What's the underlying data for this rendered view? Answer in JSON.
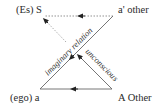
{
  "diagram": {
    "nodes": {
      "top_left": "(Es) S",
      "top_right": "a' other",
      "bottom_left": "(ego) a",
      "bottom_right": "A Other"
    },
    "edges": {
      "imaginary": "imaginary relation",
      "unconscious": "unconscious"
    },
    "colors": {
      "line": "#555555",
      "text": "#2a2a2a"
    }
  }
}
